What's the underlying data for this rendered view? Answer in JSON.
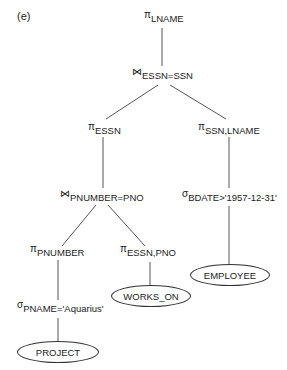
{
  "figure_label": "(e)",
  "nodes": {
    "root_project": {
      "op": "π",
      "sub": "LNAME"
    },
    "join_top": {
      "op": "⋈",
      "sub": "ESSN=SSN"
    },
    "project_essn": {
      "op": "π",
      "sub": "ESSN"
    },
    "project_ssn_lname": {
      "op": "π",
      "sub": "SSN,LNAME"
    },
    "join_pnumber": {
      "op": "⋈",
      "sub": "PNUMBER=PNO"
    },
    "select_bdate": {
      "op": "σ",
      "sub": "BDATE>'1957-12-31'"
    },
    "project_pnumber": {
      "op": "π",
      "sub": "PNUMBER"
    },
    "project_essn_pno": {
      "op": "π",
      "sub": "ESSN,PNO"
    },
    "select_pname": {
      "op": "σ",
      "sub": "PNAME='Aquarius'"
    }
  },
  "relations": {
    "employee": "EMPLOYEE",
    "works_on": "WORKS_ON",
    "project": "PROJECT"
  },
  "colors": {
    "line": "#555555",
    "text": "#222222",
    "background": "#ffffff"
  }
}
